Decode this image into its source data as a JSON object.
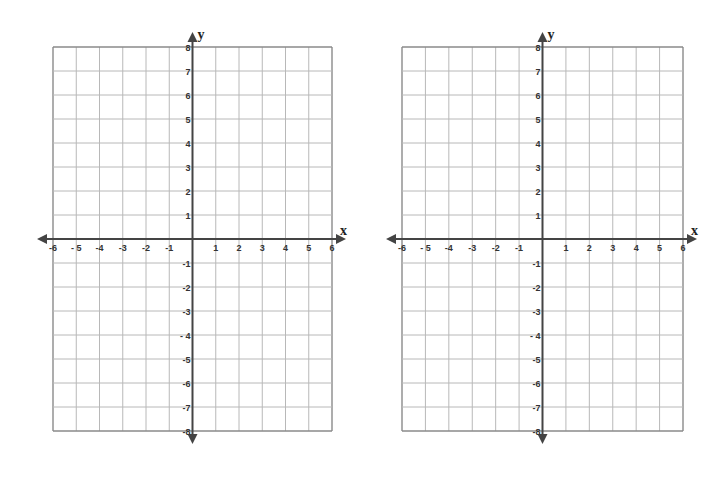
{
  "planes": [
    {
      "id": "left",
      "grid": {
        "left": 53,
        "top": 47,
        "right": 332,
        "bottom": 431
      },
      "origin": {
        "x": 193,
        "y": 238
      }
    },
    {
      "id": "right",
      "grid": {
        "left": 402,
        "top": 47,
        "right": 683,
        "bottom": 431
      },
      "origin": {
        "x": 543,
        "y": 238
      }
    }
  ],
  "axes": {
    "x_label": "x",
    "y_label": "y",
    "x_ticks": [
      "-6",
      "- 5",
      "-4",
      "-3",
      "-2",
      "-1",
      "1",
      "2",
      "3",
      "4",
      "5",
      "6"
    ],
    "x_values": [
      -6,
      -5,
      -4,
      -3,
      -2,
      -1,
      1,
      2,
      3,
      4,
      5,
      6
    ],
    "y_ticks_positive": [
      "8",
      "7",
      "6",
      "5",
      "4",
      "3",
      "2",
      "1"
    ],
    "y_ticks_negative": [
      "-1",
      "-2",
      "-3",
      "- 4",
      "-5",
      "-6",
      "-7",
      "-8"
    ],
    "x_range": [
      -6,
      6
    ],
    "y_range": [
      -8,
      8
    ]
  },
  "colors": {
    "grid": "#b8b8b8",
    "border": "#8a8a8a",
    "axis": "#444444",
    "label": "#333333"
  },
  "chart_data": {
    "type": "scatter",
    "title": "",
    "xlabel": "x",
    "ylabel": "y",
    "xlim": [
      -6,
      6
    ],
    "ylim": [
      -8,
      8
    ],
    "grid": true,
    "panels": 2,
    "series": []
  }
}
